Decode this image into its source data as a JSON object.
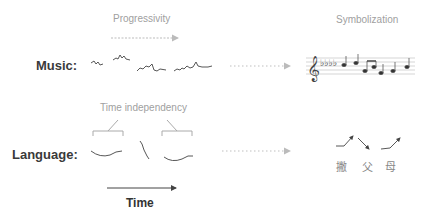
{
  "diagram": {
    "captions": {
      "progressivity": "Progressivity",
      "symbolization": "Symbolization",
      "time_independency": "Time independency"
    },
    "rows": [
      {
        "id": "music",
        "label": "Music:",
        "representation": "pitch contour segments",
        "symbol": "sheet music (treble clef, 4 flats)"
      },
      {
        "id": "language",
        "label": "Language:",
        "representation": "tone contour segments",
        "symbol": "tone arrows with characters"
      }
    ],
    "time_axis": {
      "label": "Time"
    },
    "language_symbols": {
      "characters": [
        "撇",
        "父",
        "母"
      ],
      "tone_arrows": [
        "rise",
        "fall",
        "rise"
      ]
    },
    "colors": {
      "caption": "#a0a0a0",
      "label": "#3a3a3a",
      "arrow_dotted": "#c0c0c0",
      "contour": "#444444"
    }
  }
}
